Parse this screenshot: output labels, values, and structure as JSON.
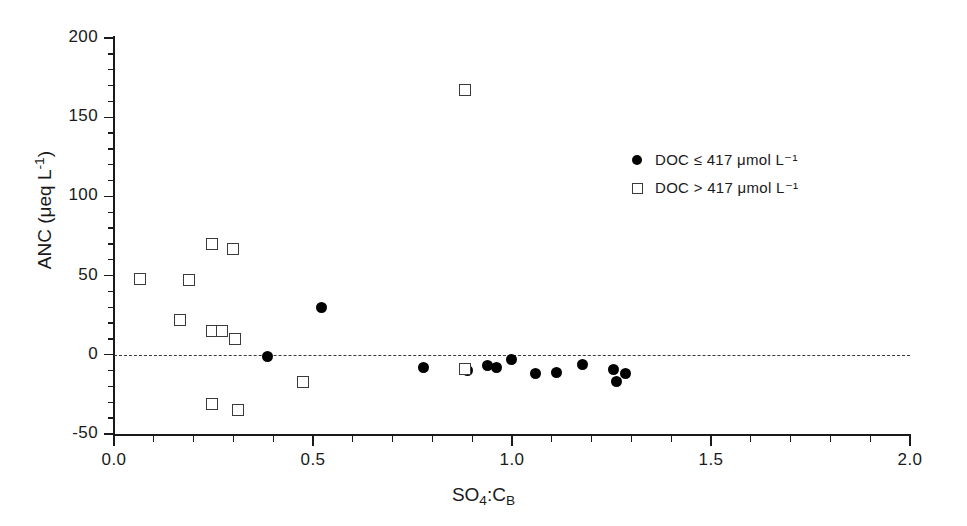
{
  "chart_data": {
    "type": "scatter",
    "title": "",
    "xlabel": "SO4:CB",
    "xlabel_parts": {
      "base1": "SO",
      "sub1": "4",
      "sep": ":",
      "base2": "C",
      "sub2": "B"
    },
    "ylabel": "ANC (μeq L⁻¹)",
    "ylabel_parts": {
      "prefix": "ANC (",
      "unit": "μeq L",
      "exp": "-1",
      "suffix": ")"
    },
    "xlim": [
      0.0,
      2.0
    ],
    "ylim": [
      -50,
      200
    ],
    "xticks": [
      0.0,
      0.5,
      1.0,
      1.5,
      2.0
    ],
    "xticklabels": [
      "0.0",
      "0.5",
      "1.0",
      "1.5",
      "2.0"
    ],
    "yticks": [
      -50,
      0,
      50,
      100,
      150,
      200
    ],
    "yticklabels": [
      "-50",
      "0",
      "50",
      "100",
      "150",
      "200"
    ],
    "x_minor_interval": 0.1,
    "y_minor_interval": 10,
    "grid": false,
    "reference_lines": [
      {
        "name": "zero-anc-line",
        "axis": "y",
        "value": 0,
        "style": "dashed",
        "color": "#3a3a3a"
      }
    ],
    "legend_position": "upper right",
    "series": [
      {
        "name": "DOC ≤ 417 μmol L⁻¹",
        "marker": "filled-circle",
        "color": "#000000",
        "points": [
          {
            "x": 0.385,
            "y": -1
          },
          {
            "x": 0.522,
            "y": 30
          },
          {
            "x": 0.778,
            "y": -8
          },
          {
            "x": 0.888,
            "y": -10
          },
          {
            "x": 0.938,
            "y": -7
          },
          {
            "x": 0.962,
            "y": -8
          },
          {
            "x": 0.998,
            "y": -3
          },
          {
            "x": 1.058,
            "y": -12
          },
          {
            "x": 1.112,
            "y": -11
          },
          {
            "x": 1.178,
            "y": -6
          },
          {
            "x": 1.255,
            "y": -9
          },
          {
            "x": 1.285,
            "y": -12
          },
          {
            "x": 1.263,
            "y": -17
          }
        ]
      },
      {
        "name": "DOC > 417 μmol L⁻¹",
        "marker": "open-square",
        "color": "#3b3b3b",
        "points": [
          {
            "x": 0.065,
            "y": 48
          },
          {
            "x": 0.188,
            "y": 47
          },
          {
            "x": 0.166,
            "y": 22
          },
          {
            "x": 0.247,
            "y": 70
          },
          {
            "x": 0.299,
            "y": 67
          },
          {
            "x": 0.247,
            "y": 15
          },
          {
            "x": 0.272,
            "y": 15
          },
          {
            "x": 0.305,
            "y": 10
          },
          {
            "x": 0.475,
            "y": -17
          },
          {
            "x": 0.247,
            "y": -31
          },
          {
            "x": 0.311,
            "y": -35
          },
          {
            "x": 0.882,
            "y": 167
          },
          {
            "x": 0.882,
            "y": -9
          }
        ]
      }
    ]
  },
  "legend": {
    "entries": [
      {
        "marker_icon": "filled-circle-icon",
        "label": "DOC ≤ 417 μmol L⁻¹"
      },
      {
        "marker_icon": "open-square-icon",
        "label": "DOC > 417 μmol L⁻¹"
      }
    ]
  }
}
